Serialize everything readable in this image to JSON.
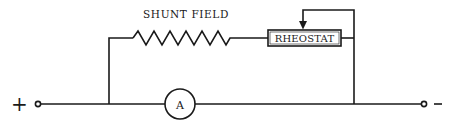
{
  "diagram": {
    "type": "circuit",
    "labels": {
      "shunt_field": "SHUNT FIELD",
      "rheostat": "RHEOSTAT",
      "ammeter": "A",
      "positive_terminal": "+",
      "negative_terminal": "−"
    },
    "components": [
      {
        "id": "positive-terminal",
        "kind": "terminal",
        "polarity": "+"
      },
      {
        "id": "ammeter",
        "kind": "meter",
        "symbol": "A"
      },
      {
        "id": "shunt-field",
        "kind": "resistor-coil",
        "label": "SHUNT FIELD"
      },
      {
        "id": "rheostat",
        "kind": "variable-resistor",
        "label": "RHEOSTAT"
      },
      {
        "id": "negative-terminal",
        "kind": "terminal",
        "polarity": "−"
      }
    ],
    "colors": {
      "line": "#1a1a1a",
      "background": "#ffffff"
    }
  }
}
